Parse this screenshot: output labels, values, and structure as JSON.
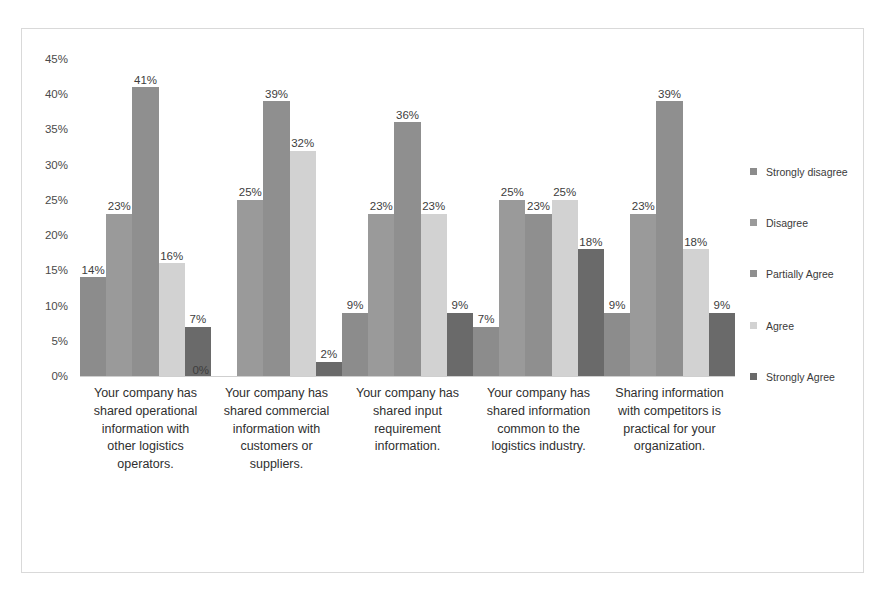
{
  "chart_data": {
    "type": "bar",
    "title": "",
    "xlabel": "",
    "ylabel": "",
    "ylim": [
      0,
      45
    ],
    "ytick_labels": [
      "45%",
      "40%",
      "35%",
      "30%",
      "25%",
      "20%",
      "15%",
      "10%",
      "5%",
      "0%"
    ],
    "ytick_values": [
      45,
      40,
      35,
      30,
      25,
      20,
      15,
      10,
      5,
      0
    ],
    "grid": false,
    "legend_position": "right",
    "categories": [
      "Your company has shared operational information with other logistics operators.",
      "Your company has shared commercial information with customers or suppliers.",
      "Your company has shared input requirement information.",
      "Your company has shared information common to the logistics industry.",
      "Sharing information with competitors is practical for your organization."
    ],
    "series": [
      {
        "name": "Strongly disagree",
        "color": "#8c8c8c",
        "values": [
          14,
          0,
          9,
          7,
          9
        ],
        "labels": [
          "14%",
          "0%",
          "9%",
          "7%",
          "9%"
        ]
      },
      {
        "name": "Disagree",
        "color": "#9a9a9a",
        "values": [
          23,
          25,
          23,
          25,
          23
        ],
        "labels": [
          "23%",
          "25%",
          "23%",
          "25%",
          "23%"
        ]
      },
      {
        "name": "Partially Agree",
        "color": "#8f8f8f",
        "values": [
          41,
          39,
          36,
          23,
          39
        ],
        "labels": [
          "41%",
          "39%",
          "36%",
          "23%",
          "39%"
        ]
      },
      {
        "name": "Agree",
        "color": "#d2d2d2",
        "values": [
          16,
          32,
          23,
          25,
          18
        ],
        "labels": [
          "16%",
          "32%",
          "23%",
          "25%",
          "18%"
        ]
      },
      {
        "name": "Strongly Agree",
        "color": "#6a6a6a",
        "values": [
          7,
          2,
          9,
          18,
          9
        ],
        "labels": [
          "7%",
          "2%",
          "9%",
          "18%",
          "9%"
        ]
      }
    ]
  },
  "legend": {
    "items": [
      {
        "label": "Strongly disagree"
      },
      {
        "label": "Disagree"
      },
      {
        "label": "Partially Agree"
      },
      {
        "label": "Agree"
      },
      {
        "label": "Strongly Agree"
      }
    ]
  },
  "caption": {
    "fragment": ""
  }
}
